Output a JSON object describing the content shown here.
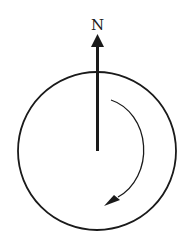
{
  "diagram": {
    "north_label": "N",
    "colors": {
      "stroke": "#1a1a1a",
      "background": "#ffffff"
    }
  }
}
